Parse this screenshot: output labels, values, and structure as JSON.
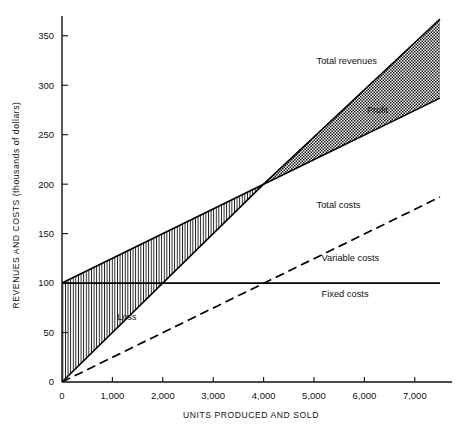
{
  "chart_data": {
    "type": "line",
    "title": "",
    "xlabel": "UNITS PRODUCED AND SOLD",
    "ylabel": "REVENUES AND COSTS (thousands of dollars)",
    "xlim": [
      0,
      7500
    ],
    "ylim": [
      0,
      370
    ],
    "grid": false,
    "legend_position": "inline-annotations",
    "x_ticks": [
      0,
      1000,
      2000,
      3000,
      4000,
      5000,
      6000,
      7000
    ],
    "x_tick_labels": [
      "0",
      "1,000",
      "2,000",
      "3,000",
      "4,000",
      "5,000",
      "6,000",
      "7,000"
    ],
    "y_ticks": [
      0,
      50,
      100,
      150,
      200,
      250,
      300,
      350
    ],
    "y_tick_labels": [
      "0",
      "50",
      "100",
      "150",
      "200",
      "250",
      "300",
      "350"
    ],
    "series": [
      {
        "name": "Total revenues",
        "style": "solid",
        "x": [
          0,
          4000,
          7500
        ],
        "values": [
          0,
          200,
          367
        ]
      },
      {
        "name": "Total costs",
        "style": "solid",
        "x": [
          0,
          4000,
          7500
        ],
        "values": [
          100,
          200,
          287
        ]
      },
      {
        "name": "Variable costs",
        "style": "dashed",
        "x": [
          0,
          7500
        ],
        "values": [
          0,
          187
        ]
      },
      {
        "name": "Fixed costs",
        "style": "solid",
        "x": [
          0,
          7500
        ],
        "values": [
          100,
          100
        ]
      }
    ],
    "annotations": [
      {
        "text": "Total revenues",
        "x": 5050,
        "y": 321
      },
      {
        "text": "Total costs",
        "x": 5050,
        "y": 176
      },
      {
        "text": "Variable costs",
        "x": 5150,
        "y": 122
      },
      {
        "text": "Fixed costs",
        "x": 5150,
        "y": 86
      },
      {
        "text": "Profit",
        "x": 6050,
        "y": 272
      },
      {
        "text": "Loss",
        "x": 1100,
        "y": 63
      }
    ],
    "regions": [
      {
        "name": "Loss",
        "fill": "vertical-hatch",
        "between": [
          "Total costs",
          "Total revenues"
        ],
        "x_range": [
          0,
          4000
        ]
      },
      {
        "name": "Profit",
        "fill": "cross-hatch",
        "between": [
          "Total costs",
          "Total revenues"
        ],
        "x_range": [
          4000,
          7500
        ]
      }
    ],
    "break_even": {
      "x": 4000,
      "y": 200
    },
    "colors": {
      "line": "#000000",
      "background": "#ffffff",
      "hatch": "#1a1a1a"
    }
  }
}
